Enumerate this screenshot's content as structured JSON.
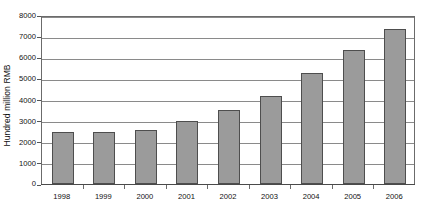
{
  "chart_data": {
    "type": "bar",
    "title": "",
    "subtitle": "",
    "xlabel": "",
    "ylabel": "Hundred million RMB",
    "categories": [
      "1998",
      "1999",
      "2000",
      "2001",
      "2002",
      "2003",
      "2004",
      "2005",
      "2006"
    ],
    "values": [
      2450,
      2450,
      2550,
      2970,
      3500,
      4150,
      5250,
      6350,
      7350
    ],
    "series": [
      {
        "name": "Hundred million RMB",
        "values": [
          2450,
          2450,
          2550,
          2970,
          3500,
          4150,
          5250,
          6350,
          7350
        ]
      }
    ],
    "ylim": [
      0,
      8000
    ],
    "ytick_labels": [
      "0",
      "1000",
      "2000",
      "3000",
      "4000",
      "5000",
      "6000",
      "7000",
      "8000"
    ],
    "ytick_values": [
      0,
      1000,
      2000,
      3000,
      4000,
      5000,
      6000,
      7000,
      8000
    ],
    "grid": true,
    "grid_axis": "y",
    "legend": false,
    "legend_position": "none",
    "bar_fill_color": "#9b9b9b",
    "bar_edge_color": "#4e4e4e",
    "gridline_color": "#8a8a8a",
    "frame_color": "#6b6b6b",
    "background_color": "#ffffff",
    "annotations": []
  }
}
